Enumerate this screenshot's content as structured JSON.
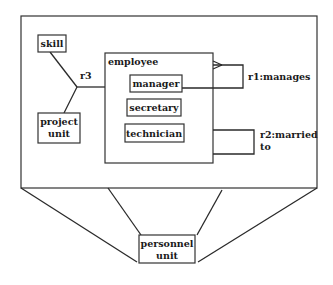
{
  "diagram": {
    "type": "entity-relationship",
    "colors": {
      "line": "#2a2a2a",
      "box_fill": "#ffffff",
      "text": "#1a1a1a"
    },
    "frame": {
      "label": ""
    },
    "entities": {
      "skill": {
        "label": "skill"
      },
      "project_unit": {
        "label_line1": "project",
        "label_line2": "unit"
      },
      "employee": {
        "label": "employee"
      },
      "manager": {
        "label": "manager"
      },
      "secretary": {
        "label": "secretary"
      },
      "technician": {
        "label": "technician"
      },
      "personnel_unit": {
        "label_line1": "personnel",
        "label_line2": "unit"
      }
    },
    "relationships": {
      "r1": {
        "label": "r1:manages",
        "from": "employee",
        "to": "manager",
        "cardinality": "many-to-one"
      },
      "r2": {
        "label_line1": "r2:married",
        "label_line2": "to",
        "from": "employee",
        "to": "employee"
      },
      "r3": {
        "label": "r3",
        "links": [
          "skill",
          "project_unit",
          "employee"
        ]
      }
    }
  }
}
